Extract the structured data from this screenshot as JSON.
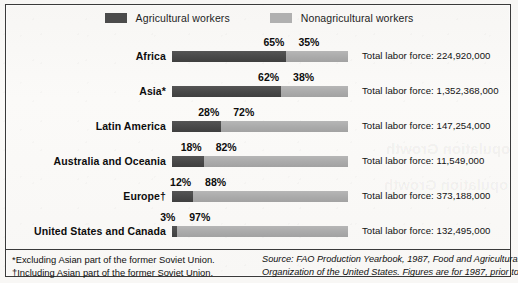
{
  "legend": {
    "items": [
      {
        "label": "Agricultural workers",
        "color": "#4b4b4b",
        "icon": "legend-swatch-dark"
      },
      {
        "label": "Nonagricultural workers",
        "color": "#b0b0b0",
        "icon": "legend-swatch-light"
      }
    ]
  },
  "rows": [
    {
      "region": "Africa",
      "agricultural_pct": "65%",
      "nonagricultural_pct": "35%",
      "total": "Total labor force: 224,920,000"
    },
    {
      "region": "Asia*",
      "agricultural_pct": "62%",
      "nonagricultural_pct": "38%",
      "total": "Total labor force: 1,352,368,000"
    },
    {
      "region": "Latin America",
      "agricultural_pct": "28%",
      "nonagricultural_pct": "72%",
      "total": "Total labor force: 147,254,000"
    },
    {
      "region": "Australia and Oceania",
      "agricultural_pct": "18%",
      "nonagricultural_pct": "82%",
      "total": "Total labor force: 11,549,000"
    },
    {
      "region": "Europe†",
      "agricultural_pct": "12%",
      "nonagricultural_pct": "88%",
      "total": "Total labor force: 373,188,000"
    },
    {
      "region": "United States and Canada",
      "agricultural_pct": "3%",
      "nonagricultural_pct": "97%",
      "total": "Total labor force: 132,495,000"
    }
  ],
  "footnotes": [
    "*Excluding Asian part of the former Soviet Union.",
    "†Including Asian part of the former Soviet Union."
  ],
  "source": [
    "Source: FAO Production Yearbook, 1987, Food and Agricultural",
    "Organization of the United States. Figures are for 1987, prior to"
  ],
  "bleed_through": {
    "line1": "opulation Growth",
    "line2": "opulation Growth"
  },
  "chart_data": {
    "type": "bar",
    "title": "",
    "subtitle": "",
    "orientation": "horizontal",
    "stacked": true,
    "stack_mode": "percent",
    "xlabel": "",
    "ylabel": "",
    "xlim": [
      0,
      100
    ],
    "grid": false,
    "legend_position": "top-center",
    "categories": [
      "Africa",
      "Asia*",
      "Latin America",
      "Australia and Oceania",
      "Europe†",
      "United States and Canada"
    ],
    "series": [
      {
        "name": "Agricultural workers",
        "color": "#4b4b4b",
        "values": [
          65,
          62,
          28,
          18,
          12,
          3
        ]
      },
      {
        "name": "Nonagricultural workers",
        "color": "#b0b0b0",
        "values": [
          35,
          38,
          72,
          82,
          88,
          97
        ]
      }
    ],
    "annotations": [
      {
        "category": "Africa",
        "text": "Total labor force: 224,920,000",
        "value": 224920000
      },
      {
        "category": "Asia*",
        "text": "Total labor force: 1,352,368,000",
        "value": 1352368000
      },
      {
        "category": "Latin America",
        "text": "Total labor force: 147,254,000",
        "value": 147254000
      },
      {
        "category": "Australia and Oceania",
        "text": "Total labor force: 11,549,000",
        "value": 11549000
      },
      {
        "category": "Europe†",
        "text": "Total labor force: 373,188,000",
        "value": 373188000
      },
      {
        "category": "United States and Canada",
        "text": "Total labor force: 132,495,000",
        "value": 132495000
      }
    ]
  }
}
